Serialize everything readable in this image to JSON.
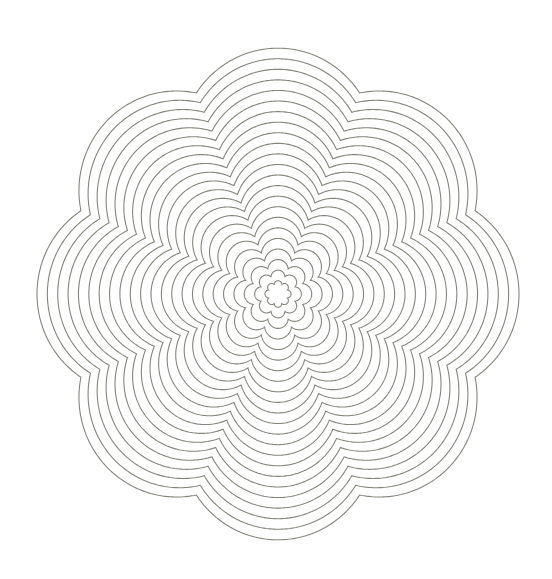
{
  "figure": {
    "background": "#ffffff",
    "stroke_color": "#85857d",
    "center": {
      "x": 278,
      "y": 294
    },
    "lobes": 8,
    "ring_count": 23,
    "innermost_peak_radius": 13,
    "outermost_peak_radius": 241,
    "vertical_stretch": 1.02,
    "valley_to_peak_ratio_outer": 0.885,
    "valley_to_peak_ratio_inner": 0.78
  }
}
